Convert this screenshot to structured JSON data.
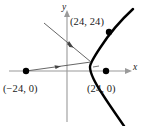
{
  "figure": {
    "background_color": "#ffffff",
    "width": 143,
    "height": 126,
    "axes": {
      "x_label": "x",
      "y_label": "y",
      "x_axis_color": "#9a9a9a",
      "y_axis_color": "#9a9a9a",
      "origin_px": [
        67,
        71
      ]
    },
    "curve": {
      "type": "hyperbola-branch",
      "color": "#000000",
      "opens": "right",
      "vertex_label": "(24, 0)"
    },
    "points": [
      {
        "id": "focus-left",
        "label": "(−24, 0)",
        "x": -24,
        "y": 0,
        "px": [
          26,
          71
        ]
      },
      {
        "id": "focus-right",
        "label": "(24, 0)",
        "x": 24,
        "y": 0,
        "px": [
          106,
          71
        ]
      },
      {
        "id": "curve-point",
        "label": "(24, 24)",
        "x": 24,
        "y": 24,
        "px": [
          109,
          32
        ]
      }
    ],
    "segments": [
      {
        "id": "ray-from-left-focus",
        "from_px": [
          26,
          71
        ],
        "to_px": [
          91,
          62
        ],
        "arrow_mid": true,
        "color": "#555555"
      },
      {
        "id": "ray-from-upper-left",
        "from_px": [
          44,
          23
        ],
        "to_px": [
          91,
          62
        ],
        "arrow_mid": true,
        "color": "#555555"
      }
    ],
    "angle_mark": {
      "id": "right-angle-tick",
      "px": [
        96,
        67
      ]
    }
  }
}
